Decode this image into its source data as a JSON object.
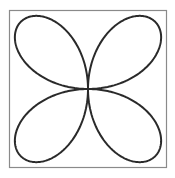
{
  "figure": {
    "frame": {
      "x": 9.5,
      "y": 10.5,
      "width": 157,
      "height": 157,
      "stroke": "#8a8a8a",
      "stroke_width": 1.2
    },
    "curve": {
      "equation": "r = a*sin(2θ)",
      "center": [
        88,
        89
      ],
      "amplitude": 95,
      "petals": 4,
      "stroke": "#2a2a2a",
      "stroke_width": 2
    }
  }
}
